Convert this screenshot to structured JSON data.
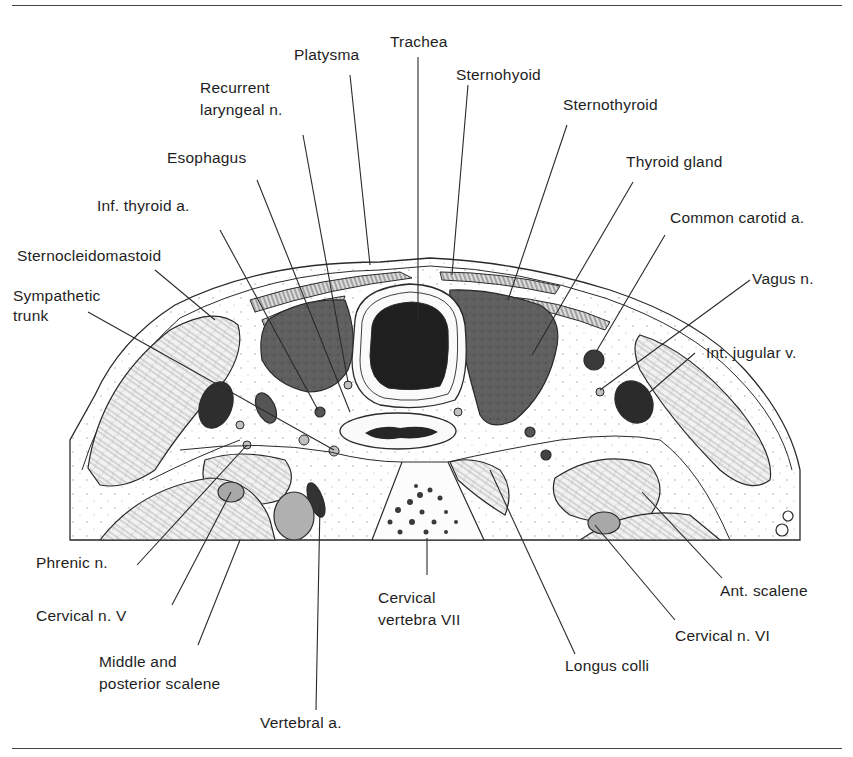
{
  "figure": {
    "type": "anatomical cross-section",
    "labels": {
      "trachea": "Trachea",
      "platysma": "Platysma",
      "sternohyoid": "Sternohyoid",
      "recurrent_laryngeal_1": "Recurrent",
      "recurrent_laryngeal_2": "laryngeal n.",
      "sternothyroid": "Sternothyroid",
      "esophagus": "Esophagus",
      "thyroid_gland": "Thyroid gland",
      "inf_thyroid": "Inf. thyroid a.",
      "common_carotid": "Common carotid a.",
      "sternocleidomastoid": "Sternocleidomastoid",
      "vagus": "Vagus n.",
      "sympathetic_1": "Sympathetic",
      "sympathetic_2": "trunk",
      "int_jugular": "Int. jugular v.",
      "phrenic": "Phrenic n.",
      "cervical_n_v": "Cervical n. V",
      "middle_posterior_1": "Middle and",
      "middle_posterior_2": "posterior scalene",
      "vertebral": "Vertebral a.",
      "cervical_vertebra_1": "Cervical",
      "cervical_vertebra_2": "vertebra VII",
      "longus_colli": "Longus colli",
      "cervical_n_vi": "Cervical n. VI",
      "ant_scalene": "Ant. scalene"
    },
    "colors": {
      "line": "#2a2a2a",
      "dark_lumen": "#1f1f1f",
      "gland": "#5e5e5e",
      "vessel": "#3a3a3a",
      "muscle_fill": "#e6e6e6",
      "nerve_fill": "#b5b5b5"
    }
  }
}
